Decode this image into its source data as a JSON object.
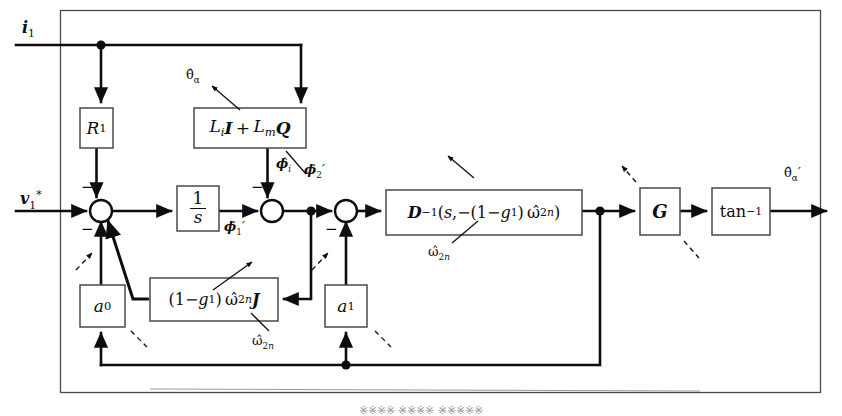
{
  "figure": {
    "type": "control-block-diagram",
    "background": "#ffffff",
    "line_color": "#0d0d0d",
    "box_fill": "#ffffff",
    "caption_cut_off": "※※※※ ※※※※ ※※※※※"
  },
  "blocks": [
    {
      "id": "R1",
      "label_html": "<i class='v'>R</i><sub>1</sub>",
      "label_text": "R1",
      "x": 80,
      "y": 108,
      "w": 33,
      "h": 40
    },
    {
      "id": "LiI_LmQ",
      "label_html": "<i class='v'>L<sub>i</sub></i><b class='bf'>I</b>&#8201;+&#8201;<i class='v'>L<sub>m</sub></i><b class='bf'>Q</b>",
      "label_text": "Li I + Lm Q",
      "x": 194,
      "y": 108,
      "w": 112,
      "h": 40
    },
    {
      "id": "integrator",
      "label_html": "<span class='frac'><span class='num'>1</span><span class='den'><i class='v'>s</i></span></span>",
      "label_text": "1/s",
      "x": 177,
      "y": 186,
      "w": 42,
      "h": 45
    },
    {
      "id": "Dinv",
      "label_html": "<b class='bf'>D</b><sup>&#8722;1</sup>(<i class='v'>s</i>,&#8722;(1&#8722;<i class='v'>g</i><sub>1</sub>)&#8201;&#969;&#770;<sub>2<i class='v'>n</i></sub>)",
      "label_text": "D^-1(s, -(1-g1) w_2n)",
      "x": 386,
      "y": 190,
      "w": 196,
      "h": 45
    },
    {
      "id": "G",
      "label_html": "<b class='bf'>G</b>",
      "label_text": "G",
      "x": 640,
      "y": 188,
      "w": 40,
      "h": 47
    },
    {
      "id": "atan",
      "label_html": "tan<sup>&#8722;1</sup>",
      "label_text": "tan^-1",
      "x": 712,
      "y": 188,
      "w": 58,
      "h": 47
    },
    {
      "id": "a0",
      "label_html": "<i class='v'>a</i><sub>0</sub>",
      "label_text": "a0",
      "x": 80,
      "y": 285,
      "w": 45,
      "h": 42
    },
    {
      "id": "gJ",
      "label_html": "(1&#8722;<i class='v'>g</i><sub>1</sub>)&#8201;&#969;&#770;<sub>2<i class='v'>n</i></sub><b class='bf'>J</b>",
      "label_text": "(1-g1) w_2n J",
      "x": 150,
      "y": 278,
      "w": 128,
      "h": 43
    },
    {
      "id": "a1",
      "label_html": "<i class='v'>a</i><sub>1</sub>",
      "label_text": "a1",
      "x": 325,
      "y": 285,
      "w": 42,
      "h": 42
    }
  ],
  "junctions": [
    {
      "id": "sum1",
      "cx": 101,
      "cy": 211,
      "r": 11,
      "signs": [
        {
          "sign": "−",
          "x": 83,
          "y": 182
        },
        {
          "sign": "−",
          "x": 83,
          "y": 224
        }
      ]
    },
    {
      "id": "sum2",
      "cx": 272,
      "cy": 211,
      "r": 11,
      "signs": [
        {
          "sign": "−",
          "x": 253,
          "y": 182
        }
      ]
    },
    {
      "id": "sum3",
      "cx": 346,
      "cy": 211,
      "r": 11,
      "signs": [
        {
          "sign": "−",
          "x": 327,
          "y": 224
        }
      ]
    }
  ],
  "nodes": [
    {
      "id": "node-i1-tap",
      "cx": 101,
      "cy": 45
    },
    {
      "id": "node-phi2",
      "cx": 311,
      "cy": 211
    },
    {
      "id": "node-dinv-out",
      "cx": 600,
      "cy": 211
    },
    {
      "id": "node-bottom",
      "cx": 346,
      "cy": 365
    }
  ],
  "signals": [
    {
      "id": "i1",
      "html": "<b class='bf'>i</b><sub>1</sub>",
      "text": "i1",
      "x": 22,
      "y": 20,
      "size": 16
    },
    {
      "id": "v1star",
      "html": "<b class='bf'>v</b><sub>1</sub><sup>*</sup>",
      "text": "v1*",
      "x": 20,
      "y": 192,
      "size": 16
    },
    {
      "id": "theta_a_hat",
      "html": "&#952;&#770;<sub>&#945;</sub>",
      "text": "theta_alpha_hat",
      "x": 189,
      "y": 70,
      "size": 15
    },
    {
      "id": "phi_i_hat",
      "html": "<b class='bf'>&#981;</b>&#770;<sub><i class='v'>i</i></sub>",
      "text": "phi_i_hat",
      "x": 277,
      "y": 160,
      "size": 15
    },
    {
      "id": "phi1_tilde",
      "html": "<b class='bf'>&#981;</b>&#771;<sub>1</sub><span style='font-style:italic'>&#8242;</span>",
      "text": "phi1_tilde_prime",
      "x": 225,
      "y": 222,
      "size": 15
    },
    {
      "id": "phi2_tilde",
      "html": "<b class='bf'>&#981;</b>&#771;<sub>2</sub><span style='font-style:italic'>&#8242;</span>",
      "text": "phi2_tilde_prime",
      "x": 306,
      "y": 165,
      "size": 15
    },
    {
      "id": "w2n_dinv",
      "html": "&#969;&#770;<sub>2<i class='v'>n</i></sub>",
      "text": "w_2n",
      "x": 430,
      "y": 248,
      "size": 14
    },
    {
      "id": "w2n_gJ",
      "html": "&#969;&#770;<sub>2<i class='v'>n</i></sub>",
      "text": "w_2n",
      "x": 253,
      "y": 338,
      "size": 14
    },
    {
      "id": "theta_out",
      "html": "&#952;&#770;<sub>&#945;</sub><span style='font-style:italic'>&#8242;</span>",
      "text": "theta_alpha_hat_prime",
      "x": 787,
      "y": 168,
      "size": 15
    }
  ],
  "leader_lines": [
    {
      "id": "leader-theta-to-LiILmQ",
      "from": [
        210,
        84
      ],
      "to": [
        240,
        110
      ]
    },
    {
      "id": "leader-phi-i-to-LiILmQ",
      "from": [
        305,
        172
      ],
      "to": [
        285,
        150
      ]
    },
    {
      "id": "leader-sum1-pointer",
      "from": [
        74,
        268
      ],
      "to": [
        90,
        252
      ]
    },
    {
      "id": "leader-gJ-to-sum1",
      "from": [
        250,
        260
      ],
      "to": [
        215,
        290
      ]
    },
    {
      "id": "leader-w2n-dinv",
      "from": [
        452,
        242
      ],
      "to": [
        476,
        222
      ]
    },
    {
      "id": "leader-dinv-arrow-up",
      "from": [
        472,
        176
      ],
      "to": [
        448,
        158
      ]
    },
    {
      "id": "leader-w2n-gJ",
      "from": [
        268,
        330
      ],
      "to": [
        250,
        312
      ]
    },
    {
      "id": "leader-sum3-pointer",
      "from": [
        310,
        268
      ],
      "to": [
        325,
        252
      ]
    },
    {
      "id": "leader-a0-pointer",
      "from": [
        72,
        272
      ],
      "to": [
        86,
        284
      ]
    },
    {
      "id": "leader-a0-down",
      "from": [
        131,
        330
      ],
      "to": [
        146,
        345
      ]
    },
    {
      "id": "leader-a1-pointer",
      "from": [
        312,
        272
      ],
      "to": [
        326,
        284
      ]
    },
    {
      "id": "leader-a1-down",
      "from": [
        374,
        330
      ],
      "to": [
        390,
        345
      ]
    },
    {
      "id": "leader-G-up",
      "from": [
        636,
        180
      ],
      "to": [
        622,
        166
      ]
    },
    {
      "id": "leader-G-down",
      "from": [
        684,
        240
      ],
      "to": [
        698,
        256
      ]
    }
  ],
  "outer_frame": {
    "x": 60,
    "y": 10,
    "w": 760,
    "h": 382
  }
}
